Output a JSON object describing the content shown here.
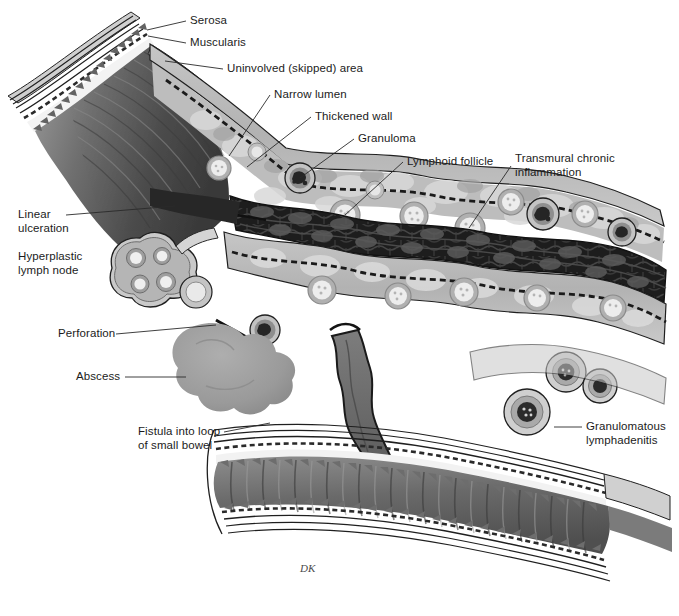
{
  "figure": {
    "background_color": "#ffffff",
    "signature": "DK",
    "width": 679,
    "height": 616
  },
  "palette": {
    "ink": "#1b1b1b",
    "leader_line": "#2a2a2a",
    "normal_mucosa_dark": "#5d5d5d",
    "normal_mucosa_mid": "#7b7b7b",
    "normal_mucosa_light": "#9a9a9a",
    "cobblestone_mucosa": "#1e1e1e",
    "cobblestone_mid": "#4a4a4a",
    "thickened_wall_fill": "#b9b9b9",
    "thickened_wall_light": "#d6d6d6",
    "submucosa_white": "#f4f4f4",
    "granuloma_dark": "#2b2b2b",
    "granuloma_ring": "#8d8d8d",
    "follicle_fill": "#e2e2e2",
    "follicle_ring": "#9e9e9e",
    "abscess_fill": "#9d9d9d",
    "fistula_dark": "#6f6f6f",
    "serosa_line": "#242424"
  },
  "labels": [
    {
      "id": "serosa",
      "name": "label-serosa",
      "text": "Serosa",
      "x": 190,
      "y": 14,
      "leader": [
        [
          186,
          21
        ],
        [
          147,
          30
        ]
      ]
    },
    {
      "id": "muscularis",
      "name": "label-muscularis",
      "text": "Muscularis",
      "x": 190,
      "y": 36,
      "leader": [
        [
          186,
          43
        ],
        [
          148,
          36
        ]
      ]
    },
    {
      "id": "uninvolved-skipped-area",
      "name": "label-uninvolved-skipped-area",
      "text": "Uninvolved (skipped) area",
      "x": 227,
      "y": 62,
      "leader": [
        [
          223,
          69
        ],
        [
          165,
          61
        ]
      ]
    },
    {
      "id": "narrow-lumen",
      "name": "label-narrow-lumen",
      "text": "Narrow lumen",
      "x": 274,
      "y": 88,
      "leader": [
        [
          270,
          95
        ],
        [
          229,
          156
        ]
      ]
    },
    {
      "id": "thickened-wall",
      "name": "label-thickened-wall",
      "text": "Thickened wall",
      "x": 315,
      "y": 110,
      "leader": [
        [
          311,
          117
        ],
        [
          247,
          167
        ]
      ]
    },
    {
      "id": "granuloma",
      "name": "label-granuloma",
      "text": "Granuloma",
      "x": 358,
      "y": 132,
      "leader": [
        [
          354,
          139
        ],
        [
          300,
          178
        ]
      ]
    },
    {
      "id": "lymphoid-follicle",
      "name": "label-lymphoid-follicle",
      "text": "Lymphoid follicle",
      "x": 407,
      "y": 155,
      "leader": [
        [
          403,
          162
        ],
        [
          345,
          215
        ]
      ]
    },
    {
      "id": "transmural-chronic-inflammation",
      "name": "label-transmural-chronic-inflammation",
      "text": "Transmural chronic\ninflammation",
      "x": 515,
      "y": 152,
      "leader": [
        [
          511,
          166
        ],
        [
          469,
          228
        ]
      ]
    },
    {
      "id": "linear-ulceration",
      "name": "label-linear-ulceration",
      "text": "Linear\nulceration",
      "x": 18,
      "y": 208,
      "leader": [
        [
          66,
          215
        ],
        [
          175,
          206
        ]
      ]
    },
    {
      "id": "hyperplastic-lymph-node",
      "name": "label-hyperplastic-lymph-node",
      "text": "Hyperplastic\nlymph node",
      "x": 18,
      "y": 250,
      "leader": null
    },
    {
      "id": "perforation",
      "name": "label-perforation",
      "text": "Perforation",
      "x": 58,
      "y": 327,
      "leader": [
        [
          116,
          334
        ],
        [
          216,
          325
        ]
      ]
    },
    {
      "id": "abscess",
      "name": "label-abscess",
      "text": "Abscess",
      "x": 76,
      "y": 370,
      "leader": [
        [
          125,
          377
        ],
        [
          186,
          377
        ]
      ]
    },
    {
      "id": "fistula-into-loop-of-small-bowel",
      "name": "label-fistula-into-loop-of-small-bowel",
      "text": "Fistula into loop\nof small bowel",
      "x": 138,
      "y": 425,
      "leader": [
        [
          224,
          432
        ],
        [
          270,
          423
        ]
      ]
    },
    {
      "id": "granulomatous-lymphadenitis",
      "name": "label-granulomatous-lymphadenitis",
      "text": "Granulomatous\nlymphadenitis",
      "x": 586,
      "y": 420,
      "leader": [
        [
          582,
          427
        ],
        [
          554,
          427
        ]
      ]
    }
  ],
  "structures": {
    "upper_normal_segment": "Uninvolved (skipped) proximal bowel with tall plicae and normal thin wall",
    "diseased_segment": "Thickened wall with transmural inflammation, granulomas and lymphoid follicles surrounding a narrow cobblestoned lumen",
    "lymph_node": "Bilobed hyperplastic mesenteric lymph node with reactive follicles",
    "abscess": "Lobulated gray abscess cavity adjacent to a perforation",
    "fistula": "Dark sinus tract descending from the diseased loop into the lower small bowel loop",
    "lower_bowel_loop": "Lower loop of small bowel with normal plicae circulares receiving the fistula",
    "granulomatous_node": "Granulomatous lymphadenitis nodes at the right cut edge"
  }
}
